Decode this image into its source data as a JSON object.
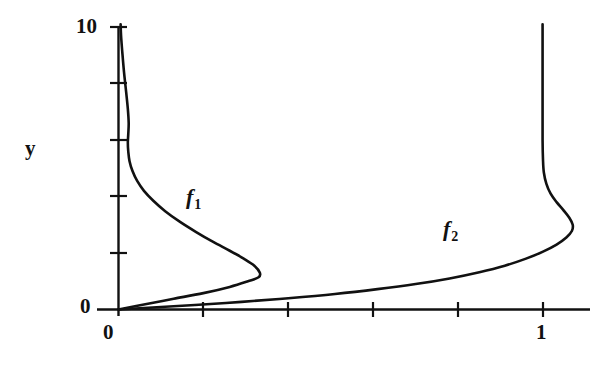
{
  "figure": {
    "kind": "line-plot",
    "background_color": "#ffffff",
    "ink_color": "#111111"
  },
  "chart_data": {
    "type": "line",
    "title": "",
    "xlabel": "",
    "ylabel": "y",
    "xlim": [
      0,
      1.28
    ],
    "ylim": [
      0,
      10.2
    ],
    "grid": false,
    "legend": "inline-annotations",
    "axes": {
      "y_axis": {
        "label": "y",
        "tick_labels": [
          "0",
          "10"
        ],
        "tick_values": [
          0,
          2,
          4,
          6,
          8,
          10
        ],
        "labelled_ticks": [
          0,
          10
        ]
      },
      "x_axis": {
        "label": "",
        "tick_labels": [
          "0",
          "1"
        ],
        "tick_values": [
          0,
          0.2,
          0.4,
          0.6,
          0.8,
          1.0
        ],
        "labelled_ticks": [
          0,
          1
        ]
      }
    },
    "annotations": [
      {
        "name": "f1-label",
        "text": "f",
        "subscript": "1",
        "x": 0.19,
        "y": 4.2
      },
      {
        "name": "f2-label",
        "text": "f",
        "subscript": "2",
        "x": 0.78,
        "y": 3.1
      }
    ],
    "series": [
      {
        "name": "f1",
        "label": "f",
        "subscript": "1",
        "description": "rises steeply from origin, bulges right to a maximum near x=0.33 at y=1.1, then sweeps back left and asymptotes toward x=0 as y increases to 10",
        "points": [
          [
            0.0,
            0.0
          ],
          [
            0.06,
            0.18
          ],
          [
            0.13,
            0.38
          ],
          [
            0.2,
            0.58
          ],
          [
            0.262,
            0.8
          ],
          [
            0.305,
            1.0
          ],
          [
            0.33,
            1.14
          ],
          [
            0.333,
            1.3
          ],
          [
            0.32,
            1.55
          ],
          [
            0.295,
            1.8
          ],
          [
            0.262,
            2.08
          ],
          [
            0.222,
            2.4
          ],
          [
            0.182,
            2.75
          ],
          [
            0.145,
            3.1
          ],
          [
            0.11,
            3.48
          ],
          [
            0.082,
            3.85
          ],
          [
            0.06,
            4.2
          ],
          [
            0.044,
            4.55
          ],
          [
            0.033,
            4.9
          ],
          [
            0.026,
            5.25
          ],
          [
            0.023,
            5.6
          ],
          [
            0.022,
            5.9
          ],
          [
            0.023,
            6.2
          ],
          [
            0.024,
            6.6
          ],
          [
            0.022,
            7.1
          ],
          [
            0.018,
            7.7
          ],
          [
            0.013,
            8.4
          ],
          [
            0.009,
            9.1
          ],
          [
            0.006,
            9.7
          ],
          [
            0.005,
            10.1
          ]
        ]
      },
      {
        "name": "f2",
        "label": "f",
        "subscript": "2",
        "description": "rises from origin along a shallow arc, curving up and right to a maximum near x=1.07 at y=2.8, then bends back to x=1 and rises vertically to y=10",
        "points": [
          [
            0.0,
            0.0
          ],
          [
            0.08,
            0.07
          ],
          [
            0.18,
            0.16
          ],
          [
            0.29,
            0.27
          ],
          [
            0.4,
            0.4
          ],
          [
            0.51,
            0.55
          ],
          [
            0.61,
            0.72
          ],
          [
            0.7,
            0.9
          ],
          [
            0.78,
            1.1
          ],
          [
            0.85,
            1.32
          ],
          [
            0.91,
            1.55
          ],
          [
            0.96,
            1.8
          ],
          [
            1.0,
            2.05
          ],
          [
            1.032,
            2.3
          ],
          [
            1.055,
            2.55
          ],
          [
            1.068,
            2.78
          ],
          [
            1.07,
            3.0
          ],
          [
            1.062,
            3.25
          ],
          [
            1.048,
            3.52
          ],
          [
            1.032,
            3.8
          ],
          [
            1.018,
            4.1
          ],
          [
            1.008,
            4.45
          ],
          [
            1.002,
            4.85
          ],
          [
            1.0,
            5.3
          ],
          [
            0.999,
            6.0
          ],
          [
            0.999,
            7.0
          ],
          [
            0.999,
            8.2
          ],
          [
            0.999,
            9.3
          ],
          [
            0.999,
            10.1
          ]
        ]
      }
    ]
  },
  "labels": {
    "y_axis_name": "y",
    "y_top": "10",
    "y_zero": "0",
    "x_zero": "0",
    "x_one": "1",
    "f1_base": "f",
    "f1_sub": "1",
    "f2_base": "f",
    "f2_sub": "2"
  }
}
